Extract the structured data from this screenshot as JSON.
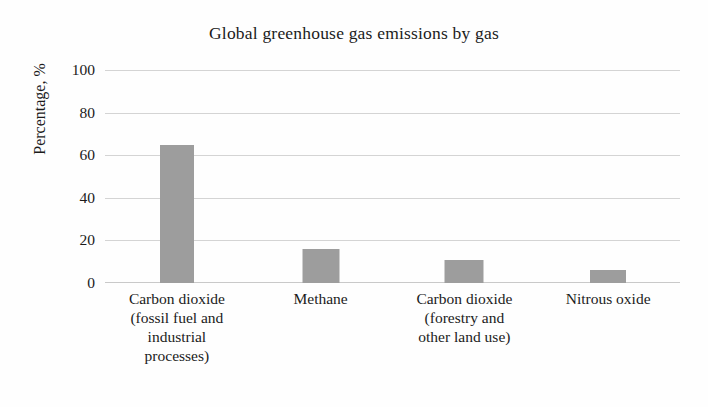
{
  "chart_data": {
    "type": "bar",
    "title": "Global greenhouse gas emissions by gas",
    "xlabel": "",
    "ylabel": "Percentage, %",
    "ylim": [
      0,
      100
    ],
    "yticks": [
      0,
      20,
      40,
      60,
      80,
      100
    ],
    "ytick_labels": [
      "0",
      "20",
      "40",
      "60",
      "80",
      "100"
    ],
    "grid": true,
    "legend": null,
    "categories": [
      "Carbon dioxide (fossil fuel and industrial processes)",
      "Methane",
      "Carbon dioxide (forestry and other land use)",
      "Nitrous oxide"
    ],
    "category_lines": [
      [
        "Carbon dioxide",
        "(fossil fuel and",
        "industrial",
        "processes)"
      ],
      [
        "Methane"
      ],
      [
        "Carbon dioxide",
        "(forestry and",
        "other land use)"
      ],
      [
        "Nitrous oxide"
      ]
    ],
    "values": [
      65,
      16,
      11,
      6
    ],
    "bar_color": "#9d9d9d",
    "gridline_color": "#d4d4d4",
    "background_color": "#fefefe",
    "text_color": "#1b1b1b"
  }
}
